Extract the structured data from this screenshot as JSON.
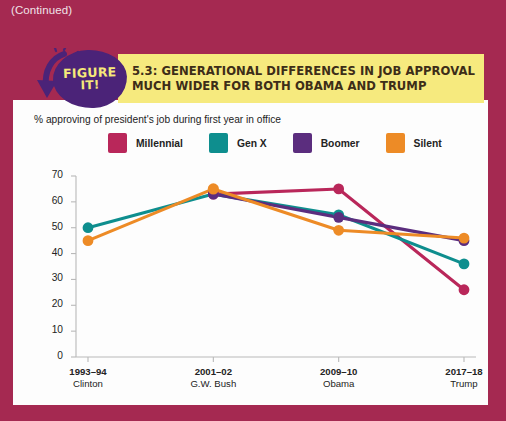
{
  "page": {
    "continued_note": "(Continued)",
    "bg_color": "#a52951"
  },
  "badge": {
    "line1": "FIGURE",
    "line2": "IT!",
    "color": "#4b2378",
    "text_color": "#f6e97a"
  },
  "banner": {
    "line1": "5.3: GENERATIONAL DIFFERENCES IN JOB APPROVAL",
    "line2": "MUCH WIDER FOR BOTH OBAMA AND TRUMP",
    "bg_color": "#f6ea7e"
  },
  "chart_data": {
    "type": "line",
    "title": "% approving of president's job during first year in office",
    "xlabel": "",
    "ylabel": "",
    "ylim": [
      0,
      70
    ],
    "yticks": [
      0,
      10,
      20,
      30,
      40,
      50,
      60,
      70
    ],
    "grid": false,
    "legend_position": "top",
    "categories": [
      "1993–94",
      "2001–02",
      "2009–10",
      "2017–18"
    ],
    "category_sublabels": [
      "Clinton",
      "G.W. Bush",
      "Obama",
      "Trump"
    ],
    "series": [
      {
        "name": "Millennial",
        "color": "#b9275a",
        "values": [
          null,
          63,
          65,
          26
        ]
      },
      {
        "name": "Gen X",
        "color": "#0e8e8e",
        "values": [
          50,
          63,
          55,
          36
        ]
      },
      {
        "name": "Boomer",
        "color": "#5b2d7e",
        "values": [
          null,
          63,
          54,
          45
        ]
      },
      {
        "name": "Silent",
        "color": "#ed8b26",
        "values": [
          45,
          65,
          49,
          46
        ]
      }
    ]
  }
}
